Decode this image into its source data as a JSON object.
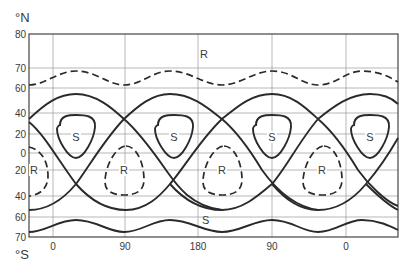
{
  "diagram": {
    "y_axis_top_unit": "°N",
    "y_axis_bottom_unit": "°S",
    "y_ticks": [
      {
        "label": "80",
        "y": 34
      },
      {
        "label": "70",
        "y": 68
      },
      {
        "label": "60",
        "y": 88
      },
      {
        "label": "40",
        "y": 113
      },
      {
        "label": "20",
        "y": 134
      },
      {
        "label": "0",
        "y": 153
      },
      {
        "label": "20",
        "y": 170
      },
      {
        "label": "40",
        "y": 196
      },
      {
        "label": "60",
        "y": 217
      },
      {
        "label": "70",
        "y": 237
      }
    ],
    "x_ticks": [
      {
        "label": "0",
        "x": 53
      },
      {
        "label": "90",
        "x": 125
      },
      {
        "label": "180",
        "x": 198
      },
      {
        "label": "90",
        "x": 272
      },
      {
        "label": "0",
        "x": 346
      }
    ],
    "region_labels": {
      "north_R": "R",
      "south_S": "S",
      "S": "S",
      "R": "R"
    },
    "s_loops": [
      {
        "label": "S",
        "cx": 76,
        "cy": 137
      },
      {
        "label": "S",
        "cx": 174,
        "cy": 137
      },
      {
        "label": "S",
        "cx": 272,
        "cy": 137
      },
      {
        "label": "S",
        "cx": 370,
        "cy": 137
      }
    ],
    "r_loops": [
      {
        "label": "R",
        "cx": 124,
        "cy": 170
      },
      {
        "label": "R",
        "cx": 222,
        "cy": 170
      },
      {
        "label": "R",
        "cx": 322,
        "cy": 170
      }
    ],
    "r_loop_left_partial": {
      "label": "R",
      "x": 34,
      "y": 170
    },
    "north_R_label": {
      "label": "R",
      "x": 200,
      "y": 58
    },
    "south_S_label": {
      "label": "S",
      "x": 202,
      "y": 224
    },
    "colors": {
      "line": "#2a2a2a",
      "grid": "#9a9a9a",
      "text": "#3a3a3a",
      "background": "#ffffff"
    }
  }
}
